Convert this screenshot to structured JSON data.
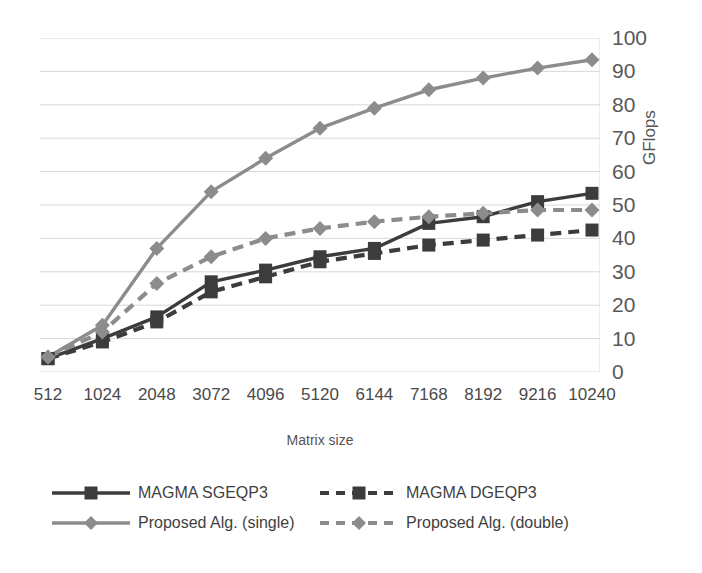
{
  "chart_data": {
    "type": "line",
    "title": "",
    "xlabel": "Matrix size",
    "ylabel": "GFlops",
    "categories": [
      "512",
      "1024",
      "2048",
      "3072",
      "4096",
      "5120",
      "6144",
      "7168",
      "8192",
      "9216",
      "10240"
    ],
    "ylim": [
      0,
      100
    ],
    "yticks": [
      "0",
      "10",
      "20",
      "30",
      "40",
      "50",
      "60",
      "70",
      "80",
      "90",
      "100"
    ],
    "y_axis_position": "right",
    "grid": true,
    "legend_position": "bottom",
    "series": [
      {
        "name": "MAGMA SGEQP3",
        "values": [
          4,
          10,
          16.5,
          27,
          30.5,
          34.5,
          37,
          44.5,
          46.5,
          51,
          53.5
        ],
        "color": "#3c3c3c",
        "line_style": "solid",
        "marker": "square"
      },
      {
        "name": "MAGMA DGEQP3",
        "values": [
          4,
          9,
          15,
          24,
          28.5,
          33,
          35.5,
          38,
          39.5,
          41,
          42.5
        ],
        "color": "#3c3c3c",
        "line_style": "dashed",
        "marker": "square"
      },
      {
        "name": "Proposed Alg. (single)",
        "values": [
          4.5,
          14,
          37,
          54,
          64,
          73,
          79,
          84.5,
          88,
          91,
          93.5
        ],
        "color": "#8c8c8c",
        "line_style": "solid",
        "marker": "diamond"
      },
      {
        "name": "Proposed Alg. (double)",
        "values": [
          4.5,
          12,
          26.5,
          34.5,
          40,
          43,
          45,
          46.5,
          47.5,
          48.5,
          48.5
        ],
        "color": "#8c8c8c",
        "line_style": "dashed",
        "marker": "diamond"
      }
    ]
  },
  "axes": {
    "x_title": "Matrix size",
    "y_title": "GFlops"
  },
  "legend": {
    "items": [
      {
        "label": "MAGMA SGEQP3"
      },
      {
        "label": "MAGMA DGEQP3"
      },
      {
        "label": "Proposed Alg. (single)"
      },
      {
        "label": "Proposed Alg. (double)"
      }
    ]
  },
  "colors": {
    "dark_series": "#3c3c3c",
    "light_series": "#8c8c8c",
    "grid": "#d8d8d8",
    "text": "#4a4a4a"
  }
}
